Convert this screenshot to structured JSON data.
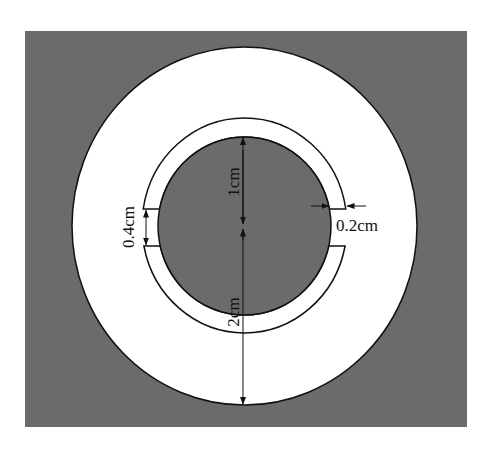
{
  "diagram": {
    "type": "cross-section",
    "colors": {
      "background": "#ffffff",
      "fill_gray": "#6b6b6b",
      "fill_white": "#ffffff",
      "stroke": "#111111"
    },
    "labels": {
      "inner_radius": "1cm",
      "outer_radius": "2cm",
      "gap_height": "0.4cm",
      "ring_width": "0.2cm"
    },
    "dimensions": [
      {
        "name": "inner-radius",
        "label": "1cm",
        "from": "center",
        "to": "inner-circle-top"
      },
      {
        "name": "outer-radius",
        "label": "2cm",
        "from": "center",
        "to": "outer-circle-bottom"
      },
      {
        "name": "gap-height",
        "label": "0.4cm",
        "location": "left gap"
      },
      {
        "name": "ring-width",
        "label": "0.2cm",
        "location": "right gap"
      }
    ]
  }
}
